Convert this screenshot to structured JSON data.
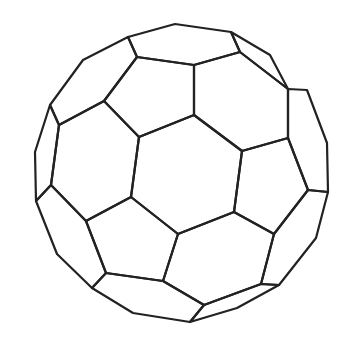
{
  "figure": {
    "stroke_color": "#222222",
    "background": "#ffffff",
    "polygons": [
      {
        "name": "center-hexagon",
        "points": [
          [
            139,
            137
          ],
          [
            194,
            115
          ],
          [
            242,
            151
          ],
          [
            234,
            212
          ],
          [
            178,
            234
          ],
          [
            131,
            197
          ]
        ]
      },
      {
        "name": "top-pentagon",
        "points": [
          [
            137,
            57
          ],
          [
            194,
            65
          ],
          [
            194,
            115
          ],
          [
            139,
            137
          ],
          [
            104,
            101
          ]
        ]
      },
      {
        "name": "upper-right-hexagon",
        "points": [
          [
            194,
            65
          ],
          [
            240,
            52
          ],
          [
            288,
            89
          ],
          [
            288,
            138
          ],
          [
            242,
            151
          ],
          [
            194,
            115
          ]
        ]
      },
      {
        "name": "left-hexagon",
        "points": [
          [
            59,
            125
          ],
          [
            104,
            101
          ],
          [
            139,
            137
          ],
          [
            131,
            197
          ],
          [
            86,
            221
          ],
          [
            51,
            185
          ]
        ]
      },
      {
        "name": "right-pentagon",
        "points": [
          [
            288,
            138
          ],
          [
            308,
            190
          ],
          [
            274,
            234
          ],
          [
            234,
            212
          ],
          [
            242,
            151
          ]
        ]
      },
      {
        "name": "bottom-left-pentagon",
        "points": [
          [
            86,
            221
          ],
          [
            131,
            197
          ],
          [
            178,
            234
          ],
          [
            163,
            281
          ],
          [
            106,
            273
          ]
        ]
      },
      {
        "name": "bottom-hexagon",
        "points": [
          [
            178,
            234
          ],
          [
            234,
            212
          ],
          [
            274,
            234
          ],
          [
            261,
            284
          ],
          [
            204,
            305
          ],
          [
            163,
            281
          ]
        ]
      },
      {
        "name": "top-left-hexagon",
        "points": [
          [
            83,
            60
          ],
          [
            128,
            37
          ],
          [
            137,
            57
          ],
          [
            104,
            101
          ],
          [
            59,
            125
          ],
          [
            50,
            105
          ]
        ]
      },
      {
        "name": "top-hexagon",
        "points": [
          [
            128,
            37
          ],
          [
            175,
            24
          ],
          [
            231,
            32
          ],
          [
            240,
            52
          ],
          [
            194,
            65
          ],
          [
            137,
            57
          ]
        ]
      },
      {
        "name": "top-right-strip",
        "points": [
          [
            231,
            32
          ],
          [
            270,
            55
          ],
          [
            288,
            89
          ],
          [
            240,
            52
          ]
        ]
      },
      {
        "name": "right-strip",
        "points": [
          [
            288,
            89
          ],
          [
            307,
            90
          ],
          [
            327,
            143
          ],
          [
            328,
            192
          ],
          [
            308,
            190
          ],
          [
            288,
            138
          ]
        ]
      },
      {
        "name": "left-strip",
        "points": [
          [
            50,
            105
          ],
          [
            59,
            125
          ],
          [
            51,
            185
          ],
          [
            36,
            201
          ],
          [
            35,
            152
          ]
        ]
      },
      {
        "name": "lower-left-strip",
        "points": [
          [
            36,
            201
          ],
          [
            51,
            185
          ],
          [
            86,
            221
          ],
          [
            106,
            273
          ],
          [
            92,
            288
          ],
          [
            57,
            254
          ]
        ]
      },
      {
        "name": "bottom-strip",
        "points": [
          [
            92,
            288
          ],
          [
            106,
            273
          ],
          [
            163,
            281
          ],
          [
            204,
            305
          ],
          [
            190,
            322
          ],
          [
            133,
            313
          ]
        ]
      },
      {
        "name": "lower-right-strip",
        "points": [
          [
            308,
            190
          ],
          [
            328,
            192
          ],
          [
            316,
            238
          ],
          [
            279,
            285
          ],
          [
            261,
            284
          ],
          [
            274,
            234
          ]
        ]
      },
      {
        "name": "bottom-right-strip",
        "points": [
          [
            261,
            284
          ],
          [
            279,
            285
          ],
          [
            237,
            308
          ],
          [
            190,
            322
          ],
          [
            204,
            305
          ]
        ]
      }
    ]
  }
}
